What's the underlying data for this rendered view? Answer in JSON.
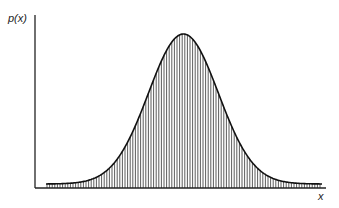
{
  "chart_data": {
    "type": "area",
    "title": "",
    "xlabel": "x",
    "ylabel": "p(x)",
    "distribution": "normal",
    "x_ticks": [],
    "y_ticks": [],
    "grid": false,
    "legend": null,
    "fill_pattern": "vertical-hatch",
    "series": [
      {
        "name": "p(x)",
        "shape": "gaussian",
        "peak_relative_x": 0.51,
        "peak_value_relative": 1.0,
        "sigma_relative": 0.12
      }
    ],
    "colors": {
      "line": "#111111",
      "hatch": "#333333",
      "background": "#ffffff"
    }
  },
  "labels": {
    "y": "p(x)",
    "x": "x"
  }
}
